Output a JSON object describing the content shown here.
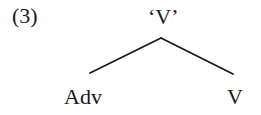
{
  "figure": {
    "example_number": "(3)",
    "background_color": "#ffffff",
    "ink_color": "#1a1a1a"
  },
  "tree": {
    "root": {
      "label": "‘V’",
      "x": 161,
      "y": 20
    },
    "children": [
      {
        "label": "Adv",
        "x": 90,
        "y": 97
      },
      {
        "label": "V",
        "x": 233,
        "y": 97
      }
    ],
    "branches": [
      {
        "name": "left-branch",
        "x1": 161,
        "y1": 38,
        "x2": 90,
        "y2": 73
      },
      {
        "name": "right-branch",
        "x1": 161,
        "y1": 38,
        "x2": 233,
        "y2": 74
      }
    ]
  }
}
